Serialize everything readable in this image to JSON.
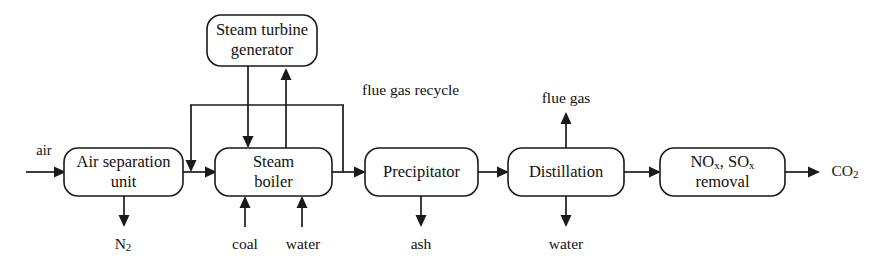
{
  "diagram": {
    "type": "process-flow-diagram",
    "background_color": "#ffffff",
    "line_color": "#1a1a1a",
    "text_color": "#111111",
    "nodes": [
      {
        "id": "air-separation-unit",
        "label_line1": "Air separation",
        "label_line2": "unit"
      },
      {
        "id": "steam-turbine-generator",
        "label_line1": "Steam turbine",
        "label_line2": "generator"
      },
      {
        "id": "steam-boiler",
        "label_line1": "Steam",
        "label_line2": "boiler"
      },
      {
        "id": "precipitator",
        "label_line1": "Precipitator",
        "label_line2": ""
      },
      {
        "id": "distillation",
        "label_line1": "Distillation",
        "label_line2": ""
      },
      {
        "id": "nox-sox-removal",
        "label_line1": "NO",
        "label_sub1": "x",
        "label_mid": ", SO",
        "label_sub2": "x",
        "label_line2": "removal"
      }
    ],
    "streams": {
      "air_inlet": "air",
      "nitrogen_outlet": "N",
      "nitrogen_outlet_sub": "2",
      "coal_inlet": "coal",
      "water_inlet": "water",
      "ash_outlet": "ash",
      "flue_gas_outlet": "flue gas",
      "water_outlet": "water",
      "co2_outlet": "CO",
      "co2_outlet_sub": "2",
      "flue_gas_recycle": "flue gas recycle"
    }
  }
}
